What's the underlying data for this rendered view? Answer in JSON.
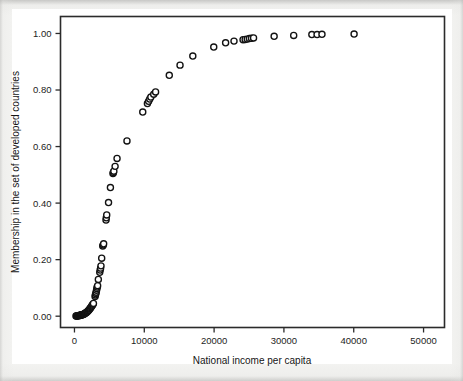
{
  "figure": {
    "background_color": "#f3f3f1",
    "paper_color": "#ffffff",
    "axis_color": "#2b2b2b",
    "marker_color": "#121212"
  },
  "chart_data": {
    "type": "scatter",
    "title": "",
    "subtitle": "",
    "xlabel": "National income per capita",
    "ylabel": "Membership in the set of developed countries",
    "xlim": [
      -2000,
      53000
    ],
    "ylim": [
      -0.04,
      1.06
    ],
    "xticks": [
      0,
      10000,
      20000,
      30000,
      40000,
      50000
    ],
    "xticklabels": [
      "0",
      "10000",
      "20000",
      "30000",
      "40000",
      "50000"
    ],
    "yticks": [
      0.0,
      0.2,
      0.4,
      0.6,
      0.8,
      1.0
    ],
    "yticklabels": [
      "0.00",
      "0.20",
      "0.40",
      "0.60",
      "0.80",
      "1.00"
    ],
    "grid": false,
    "legend": null,
    "marker": {
      "shape": "circle-open",
      "size": 4.1,
      "facecolor": "#ffffff",
      "edgecolor": "#121212"
    },
    "series": [
      {
        "name": "countries",
        "points": [
          [
            220,
            0.001
          ],
          [
            300,
            0.001
          ],
          [
            380,
            0.001
          ],
          [
            440,
            0.001
          ],
          [
            520,
            0.002
          ],
          [
            600,
            0.002
          ],
          [
            680,
            0.002
          ],
          [
            740,
            0.003
          ],
          [
            810,
            0.003
          ],
          [
            880,
            0.003
          ],
          [
            940,
            0.004
          ],
          [
            1000,
            0.004
          ],
          [
            1080,
            0.005
          ],
          [
            1150,
            0.005
          ],
          [
            1220,
            0.006
          ],
          [
            1300,
            0.007
          ],
          [
            1380,
            0.008
          ],
          [
            1450,
            0.009
          ],
          [
            1520,
            0.01
          ],
          [
            1600,
            0.011
          ],
          [
            1680,
            0.013
          ],
          [
            1760,
            0.014
          ],
          [
            1840,
            0.016
          ],
          [
            1920,
            0.018
          ],
          [
            2000,
            0.02
          ],
          [
            2080,
            0.022
          ],
          [
            2160,
            0.025
          ],
          [
            2240,
            0.027
          ],
          [
            2320,
            0.03
          ],
          [
            2400,
            0.033
          ],
          [
            2480,
            0.036
          ],
          [
            2560,
            0.039
          ],
          [
            2640,
            0.042
          ],
          [
            2720,
            0.045
          ],
          [
            2950,
            0.07
          ],
          [
            3000,
            0.075
          ],
          [
            3060,
            0.08
          ],
          [
            3110,
            0.085
          ],
          [
            3160,
            0.092
          ],
          [
            3210,
            0.098
          ],
          [
            3260,
            0.103
          ],
          [
            3320,
            0.108
          ],
          [
            3420,
            0.13
          ],
          [
            3620,
            0.155
          ],
          [
            3680,
            0.163
          ],
          [
            3740,
            0.17
          ],
          [
            3800,
            0.178
          ],
          [
            3900,
            0.205
          ],
          [
            4050,
            0.248
          ],
          [
            4120,
            0.252
          ],
          [
            4180,
            0.256
          ],
          [
            4520,
            0.34
          ],
          [
            4560,
            0.348
          ],
          [
            4620,
            0.358
          ],
          [
            4880,
            0.402
          ],
          [
            5150,
            0.455
          ],
          [
            5520,
            0.505
          ],
          [
            5570,
            0.508
          ],
          [
            5640,
            0.513
          ],
          [
            5820,
            0.53
          ],
          [
            6100,
            0.558
          ],
          [
            7520,
            0.62
          ],
          [
            9780,
            0.722
          ],
          [
            10450,
            0.752
          ],
          [
            10620,
            0.76
          ],
          [
            10780,
            0.768
          ],
          [
            10940,
            0.775
          ],
          [
            11350,
            0.785
          ],
          [
            11620,
            0.793
          ],
          [
            13580,
            0.852
          ],
          [
            15120,
            0.888
          ],
          [
            16950,
            0.92
          ],
          [
            19950,
            0.952
          ],
          [
            21650,
            0.967
          ],
          [
            22850,
            0.973
          ],
          [
            24150,
            0.978
          ],
          [
            24450,
            0.979
          ],
          [
            24750,
            0.98
          ],
          [
            25050,
            0.982
          ],
          [
            25350,
            0.983
          ],
          [
            25650,
            0.984
          ],
          [
            28600,
            0.99
          ],
          [
            31400,
            0.993
          ],
          [
            34000,
            0.996
          ],
          [
            34750,
            0.996
          ],
          [
            35450,
            0.997
          ],
          [
            40050,
            0.998
          ]
        ]
      }
    ]
  }
}
